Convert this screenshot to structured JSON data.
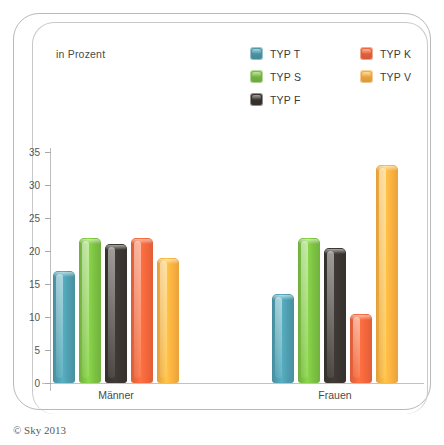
{
  "panel": {
    "unit_label": "in Prozent"
  },
  "legend": {
    "columns": [
      {
        "items": [
          {
            "label": "TYP T",
            "color": "#4e9dae",
            "icon": "legend-swatch-icon"
          },
          {
            "label": "TYP S",
            "color": "#7cc143",
            "icon": "legend-swatch-icon"
          },
          {
            "label": "TYP F",
            "color": "#3a3530",
            "icon": "legend-swatch-icon"
          }
        ]
      },
      {
        "items": [
          {
            "label": "TYP K",
            "color": "#f3663c",
            "icon": "legend-swatch-icon"
          },
          {
            "label": "TYP V",
            "color": "#fbb040",
            "icon": "legend-swatch-icon"
          }
        ]
      }
    ]
  },
  "footer": {
    "copyright": "© Sky 2013"
  },
  "chart_data": {
    "type": "bar",
    "title": "",
    "subtitle": "",
    "xlabel": "",
    "ylabel": "in Prozent",
    "ylim": [
      0,
      35
    ],
    "yticks": [
      0,
      5,
      10,
      15,
      20,
      25,
      30,
      35
    ],
    "ytick_labels": [
      "0",
      "5",
      "10",
      "15",
      "20",
      "25",
      "30",
      "35"
    ],
    "grid": false,
    "legend_position": "top-right",
    "categories": [
      "Männer",
      "Frauen"
    ],
    "series": [
      {
        "name": "TYP T",
        "color": "#4e9dae",
        "values": [
          17,
          13.5
        ]
      },
      {
        "name": "TYP S",
        "color": "#7cc143",
        "values": [
          22,
          22
        ]
      },
      {
        "name": "TYP F",
        "color": "#3a3530",
        "values": [
          21,
          20.5
        ]
      },
      {
        "name": "TYP K",
        "color": "#f3663c",
        "values": [
          22,
          10.5
        ]
      },
      {
        "name": "TYP V",
        "color": "#fbb040",
        "values": [
          19,
          33
        ]
      }
    ]
  }
}
